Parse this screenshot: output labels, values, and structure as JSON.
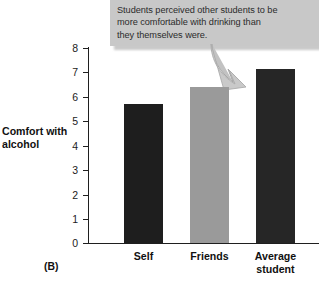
{
  "annotation": {
    "text": "Students perceived other students to be\nmore comfortable with drinking than\nthey themselves were.",
    "background_color": "#c8c8c8",
    "arrow_color": "#bdbdbd",
    "arrow_name": "curved-arrow-to-average-student-bar"
  },
  "panel": {
    "label": "(B)"
  },
  "axis": {
    "y_title": "Comfort with\nalcohol",
    "y_ticks": [
      "8",
      "7",
      "6",
      "5",
      "4",
      "3",
      "2",
      "1",
      "0"
    ]
  },
  "chart_data": {
    "type": "bar",
    "title": "",
    "xlabel": "",
    "ylabel": "Comfort with alcohol",
    "ylim": [
      0,
      8
    ],
    "ytick_values": [
      0,
      1,
      2,
      3,
      4,
      5,
      6,
      7,
      8
    ],
    "grid": false,
    "legend": "none",
    "categories": [
      "Self",
      "Friends",
      "Average student"
    ],
    "values": [
      5.7,
      6.4,
      7.15
    ],
    "bar_colors": [
      "#1e1e1e",
      "#9a9a9a",
      "#262626"
    ],
    "annotations": [
      "Students perceived other students to be more comfortable with drinking than they themselves were."
    ]
  }
}
